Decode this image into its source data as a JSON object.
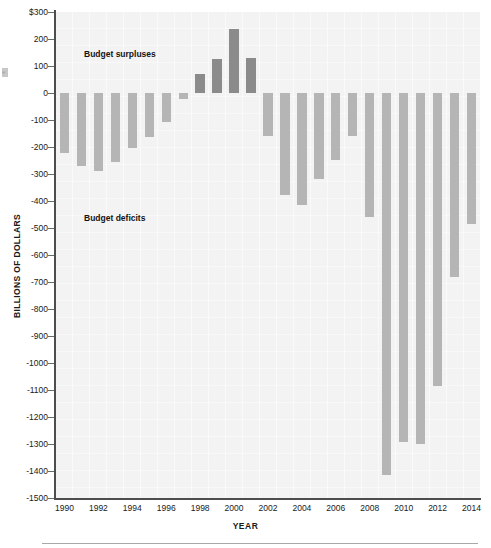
{
  "chart_data": {
    "type": "bar",
    "title": "",
    "xlabel": "YEAR",
    "ylabel": "BILLIONS OF DOLLARS",
    "ylim": [
      -1500,
      300
    ],
    "grid": true,
    "legend": "none",
    "annotations": [
      {
        "id": "surplus",
        "text": "Budget surpluses"
      },
      {
        "id": "deficit",
        "text": "Budget deficits"
      }
    ],
    "ytick_labels": [
      "$300",
      "200",
      "100",
      "0",
      "-100",
      "-200",
      "-300",
      "-400",
      "-500",
      "-600",
      "-700",
      "-800",
      "-900",
      "-1000",
      "-1100",
      "-1200",
      "-1300",
      "-1400",
      "-1500"
    ],
    "ytick_values": [
      300,
      200,
      100,
      0,
      -100,
      -200,
      -300,
      -400,
      -500,
      -600,
      -700,
      -800,
      -900,
      -1000,
      -1100,
      -1200,
      -1300,
      -1400,
      -1500
    ],
    "xtick_labels": [
      "1990",
      "1992",
      "1994",
      "1996",
      "1998",
      "2000",
      "2002",
      "2004",
      "2006",
      "2008",
      "2010",
      "2012",
      "2014"
    ],
    "xtick_values": [
      1990,
      1992,
      1994,
      1996,
      1998,
      2000,
      2002,
      2004,
      2006,
      2008,
      2010,
      2012,
      2014
    ],
    "categories": [
      1990,
      1991,
      1992,
      1993,
      1994,
      1995,
      1996,
      1997,
      1998,
      1999,
      2000,
      2001,
      2002,
      2003,
      2004,
      2005,
      2006,
      2007,
      2008,
      2009,
      2010,
      2011,
      2012,
      2013,
      2014
    ],
    "values": [
      -221,
      -269,
      -290,
      -255,
      -203,
      -164,
      -107,
      -22,
      69,
      126,
      236,
      128,
      -158,
      -378,
      -413,
      -318,
      -248,
      -161,
      -459,
      -1413,
      -1294,
      -1300,
      -1087,
      -680,
      -485
    ],
    "colors": {
      "deficit": "#b5b5b5",
      "surplus": "#8b8b8b",
      "plot_background": "#f3f3f3",
      "axis": "#4d4d4d"
    }
  },
  "margin": {
    "artifact": "e"
  }
}
